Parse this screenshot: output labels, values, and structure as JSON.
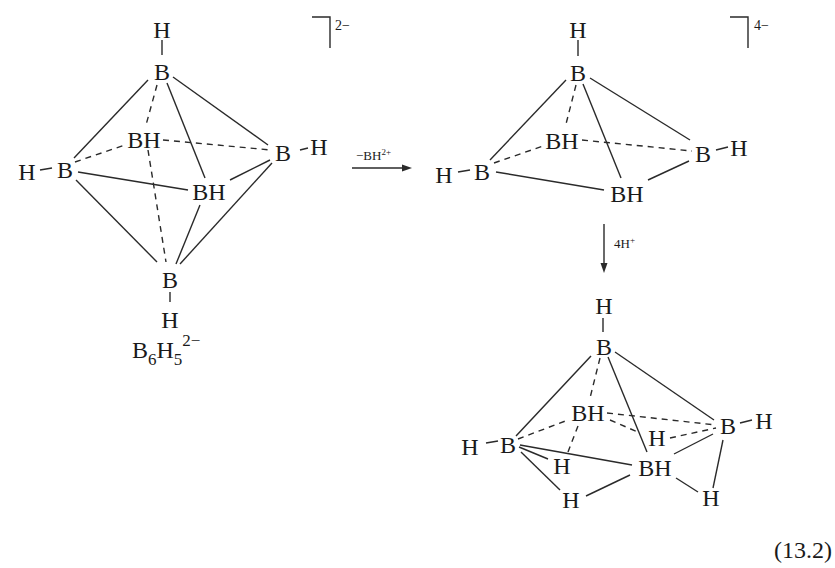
{
  "figure": {
    "type": "reaction scheme",
    "equation_number": "(13.2)"
  },
  "reactant": {
    "name": "octahedral borane dianion",
    "formula_label": {
      "main": "B",
      "sub1": "6",
      "h": "H",
      "sub2": "5",
      "charge": "2−"
    },
    "charge_bracket": "2−",
    "atoms": {
      "top_h": "H",
      "top_b": "B",
      "left_h": "H",
      "left_b": "B",
      "back_bh": "BH",
      "right_b": "B",
      "right_h": "H",
      "front_bh": "BH",
      "bottom_b": "B",
      "bottom_h": "H"
    }
  },
  "step1": {
    "reagent": "−BH",
    "reagent_charge": "2+",
    "direction": "right"
  },
  "intermediate": {
    "name": "square pyramidal anion",
    "charge_bracket": "4−",
    "atoms": {
      "top_h": "H",
      "top_b": "B",
      "left_h": "H",
      "left_b": "B",
      "back_bh": "BH",
      "right_b": "B",
      "right_h": "H",
      "front_bh": "BH"
    }
  },
  "step2": {
    "reagent": "4H",
    "reagent_charge": "+",
    "direction": "down"
  },
  "product": {
    "name": "nido pentaborane-type product with bridging hydrogens",
    "atoms": {
      "top_h": "H",
      "top_b": "B",
      "left_h": "H",
      "left_b": "B",
      "back_bh": "BH",
      "right_b": "B",
      "right_h": "H",
      "front_bh": "BH",
      "bridge_h_back_right": "H",
      "bridge_h_left_back": "H",
      "bridge_h_left_front": "H",
      "bridge_h_front_right": "H"
    }
  }
}
